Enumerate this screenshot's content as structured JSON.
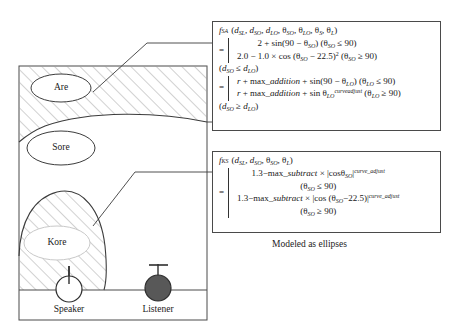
{
  "figure": {
    "title_caption": "Modeled as ellipses",
    "diagram": {
      "name": "speaker-listener-ellipse-diagram",
      "ellipses": [
        {
          "label": "Are",
          "cx": 61,
          "cy": 88,
          "rx": 30,
          "ry": 14
        },
        {
          "label": "Sore",
          "cx": 61,
          "cy": 148,
          "rx": 33,
          "ry": 17
        },
        {
          "label": "Kore",
          "cx": 57,
          "cy": 243,
          "rx": 33,
          "ry": 17
        }
      ],
      "actors": [
        {
          "label": "Speaker",
          "cx": 69,
          "cy": 289,
          "r": 13,
          "fill": "#ffffff"
        },
        {
          "label": "Listener",
          "cx": 158,
          "cy": 288,
          "r": 13,
          "fill": "#585858"
        }
      ],
      "frame": {
        "x": 18,
        "y": 65,
        "w": 190,
        "h": 255
      },
      "ground_line_y": 290
    },
    "colors": {
      "stroke": "#3c3c3c",
      "hatch": "#8c8c8c",
      "box_border": "#4a4a4a",
      "listener_fill": "#585858",
      "speaker_fill": "#ffffff",
      "background": "#ffffff"
    }
  },
  "formulas": {
    "sa": {
      "name": "f_SA",
      "signature": {
        "fn": "f",
        "fn_sub": "SA",
        "args": "(d_SL, d_SO, d_LO, θ_SO, θ_LO, θ_S, θ_L)"
      },
      "case_group_1": {
        "line_1": "2 + sin(90 − θ_SO)  (θ_SO ≤ 90)",
        "line_2": "2.0 − 1.0 × cos (θ_SO − 22.5)²  (θ_SO ≥ 90)",
        "condition": "(d_SO ≤ d_LO)"
      },
      "case_group_2": {
        "line_1": "r + max_addition + sin(90 − θ_LO)  (θ_LO ≤ 90)",
        "line_2": "r + max_addition + sin θ_LO^curveadjust  (θ_LO ≥ 90)",
        "condition": "(d_SO ≥ d_LO)"
      }
    },
    "ks": {
      "name": "f_KS",
      "signature": {
        "fn": "f",
        "fn_sub": "KS",
        "args": "(d_SL, d_SO, θ_SO, θ_L)"
      },
      "case_group_1": {
        "line_1": "1.3−max_subtract × |cosθ_SO|^curve_adjust",
        "condition": "(θ_SO ≤ 90)"
      },
      "case_group_2": {
        "line_1": "1.3−max_subtract × |cos (θ_SO − 22.5)|^curve_adjust",
        "condition": "(θ_SO ≥ 90)"
      }
    }
  }
}
